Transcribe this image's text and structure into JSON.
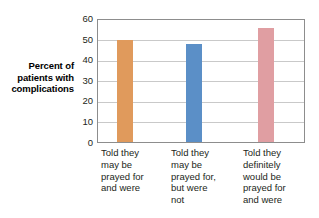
{
  "chart_data": {
    "type": "bar",
    "title": "",
    "subtitle": "",
    "xlabel": "",
    "ylabel": "Percent of patients with complications",
    "ylabel_lines": [
      "Percent of",
      "patients with",
      "complications"
    ],
    "categories": [
      "Told they may be prayed for and were",
      "Told they may be prayed for, but were not",
      "Told they definitely would be prayed for and were"
    ],
    "category_lines": [
      [
        "Told they",
        "may be",
        "prayed for",
        "and were"
      ],
      [
        "Told they",
        "may be",
        "prayed for,",
        "but were",
        "not"
      ],
      [
        "Told they",
        "definitely",
        "would be",
        "prayed for",
        "and were"
      ]
    ],
    "values": [
      50,
      48,
      56
    ],
    "bar_colors": [
      "#E09A5C",
      "#5B8FC7",
      "#E09EA2"
    ],
    "ylim": [
      0,
      60
    ],
    "ytick_labels": [
      "60",
      "50",
      "40",
      "30",
      "20",
      "10",
      "0"
    ],
    "ytick_values": [
      60,
      50,
      40,
      30,
      20,
      10,
      0
    ],
    "grid": true,
    "grid_color": "#c9c9c9",
    "legend": "none",
    "frame_color": "#8d8d8d",
    "background": "#ffffff"
  }
}
